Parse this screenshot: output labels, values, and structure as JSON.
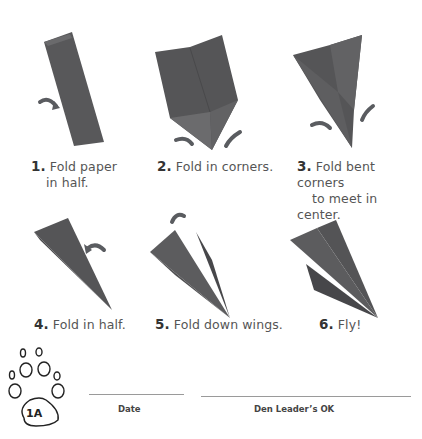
{
  "colors": {
    "paper": "#555557",
    "paper_light": "#6a6a6c",
    "arrow": "#5a5c60",
    "text": "#555555"
  },
  "steps": [
    {
      "number": "1.",
      "line1": "Fold paper",
      "line2": "in half."
    },
    {
      "number": "2.",
      "line1": "Fold in corners.",
      "line2": ""
    },
    {
      "number": "3.",
      "line1": "Fold bent corners",
      "line2": "to meet in center."
    },
    {
      "number": "4.",
      "line1": "Fold in half.",
      "line2": ""
    },
    {
      "number": "5.",
      "line1": "Fold down wings.",
      "line2": ""
    },
    {
      "number": "6.",
      "line1": "Fly!",
      "line2": ""
    }
  ],
  "badge": {
    "label": "1A",
    "icon": "paw-print-icon"
  },
  "signoff": {
    "date_label": "Date",
    "leader_label": "Den Leader’s OK"
  }
}
